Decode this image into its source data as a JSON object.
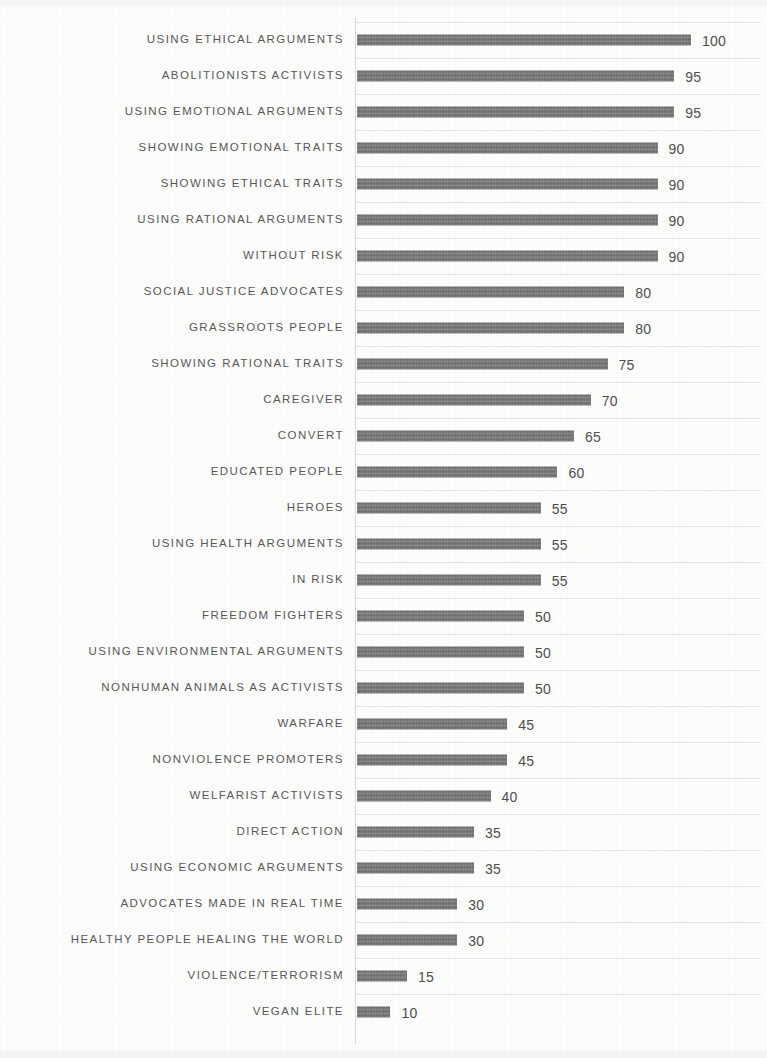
{
  "chart_data": {
    "type": "bar",
    "orientation": "horizontal",
    "title": "",
    "subtitle": "",
    "xlabel": "",
    "ylabel": "",
    "xlim": [
      0,
      100
    ],
    "grid": true,
    "legend": null,
    "bar_color": "#6f6f6f",
    "gridline_color": "#e6e5e1",
    "axis_color": "#d8d8d4",
    "label_color": "#585858",
    "value_label_color": "#4e4e4e",
    "value_labels_shown": true,
    "categories": [
      "USING ETHICAL ARGUMENTS",
      "ABOLITIONISTS ACTIVISTS",
      "USING EMOTIONAL ARGUMENTS",
      "SHOWING EMOTIONAL TRAITS",
      "SHOWING ETHICAL TRAITS",
      "USING RATIONAL ARGUMENTS",
      "WITHOUT RISK",
      "SOCIAL JUSTICE ADVOCATES",
      "GRASSROOTS PEOPLE",
      "SHOWING RATIONAL TRAITS",
      "CAREGIVER",
      "CONVERT",
      "EDUCATED PEOPLE",
      "HEROES",
      "USING HEALTH ARGUMENTS",
      "IN RISK",
      "FREEDOM FIGHTERS",
      "USING ENVIRONMENTAL ARGUMENTS",
      "NONHUMAN ANIMALS AS ACTIVISTS",
      "WARFARE",
      "NONVIOLENCE PROMOTERS",
      "WELFARIST ACTIVISTS",
      "DIRECT ACTION",
      "USING ECONOMIC ARGUMENTS",
      "ADVOCATES MADE IN REAL TIME",
      "HEALTHY PEOPLE HEALING THE WORLD",
      "VIOLENCE/TERRORISM",
      "VEGAN ELITE"
    ],
    "values": [
      100,
      95,
      95,
      90,
      90,
      90,
      90,
      80,
      80,
      75,
      70,
      65,
      60,
      55,
      55,
      55,
      50,
      50,
      50,
      45,
      45,
      40,
      35,
      35,
      30,
      30,
      15,
      10
    ]
  }
}
